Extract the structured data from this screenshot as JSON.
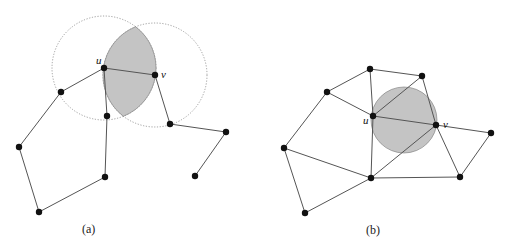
{
  "figure_a": {
    "caption": "(a)",
    "label_u": "u",
    "label_v": "v",
    "circles": [
      {
        "cx": 104,
        "cy": 68,
        "r": 52
      },
      {
        "cx": 155,
        "cy": 75,
        "r": 52
      }
    ],
    "nodes": {
      "u": [
        104,
        68
      ],
      "v": [
        155,
        75
      ],
      "n1": [
        61,
        92
      ],
      "n2": [
        107,
        116
      ],
      "n3": [
        170,
        124
      ],
      "n4": [
        226,
        132
      ],
      "n5": [
        19,
        147
      ],
      "n6": [
        105,
        177
      ],
      "n7": [
        195,
        176
      ],
      "n8": [
        39,
        212
      ]
    },
    "edges": [
      [
        "n1",
        "u"
      ],
      [
        "u",
        "v"
      ],
      [
        "u",
        "n2"
      ],
      [
        "n2",
        "n6"
      ],
      [
        "n6",
        "n8"
      ],
      [
        "n8",
        "n5"
      ],
      [
        "n5",
        "n1"
      ],
      [
        "v",
        "n3"
      ],
      [
        "n3",
        "n4"
      ],
      [
        "n4",
        "n7"
      ]
    ]
  },
  "figure_b": {
    "caption": "(b)",
    "label_u": "u",
    "label_v": "v",
    "circle": {
      "cx": 404,
      "cy": 120,
      "r": 33
    },
    "nodes": {
      "u": [
        373,
        116
      ],
      "v": [
        436,
        125
      ],
      "t1": [
        370,
        69
      ],
      "t2": [
        422,
        76
      ],
      "lu": [
        327,
        92
      ],
      "r": [
        491,
        133
      ],
      "fl": [
        284,
        148
      ],
      "bm": [
        371,
        178
      ],
      "br": [
        460,
        177
      ],
      "bl": [
        305,
        213
      ]
    },
    "edges": [
      [
        "t1",
        "t2"
      ],
      [
        "t1",
        "lu"
      ],
      [
        "t1",
        "u"
      ],
      [
        "t2",
        "u"
      ],
      [
        "t2",
        "v"
      ],
      [
        "lu",
        "u"
      ],
      [
        "lu",
        "fl"
      ],
      [
        "u",
        "v"
      ],
      [
        "u",
        "bm"
      ],
      [
        "v",
        "bm"
      ],
      [
        "v",
        "r"
      ],
      [
        "v",
        "br"
      ],
      [
        "r",
        "br"
      ],
      [
        "fl",
        "bm"
      ],
      [
        "fl",
        "bl"
      ],
      [
        "bl",
        "bm"
      ],
      [
        "bm",
        "br"
      ]
    ]
  }
}
